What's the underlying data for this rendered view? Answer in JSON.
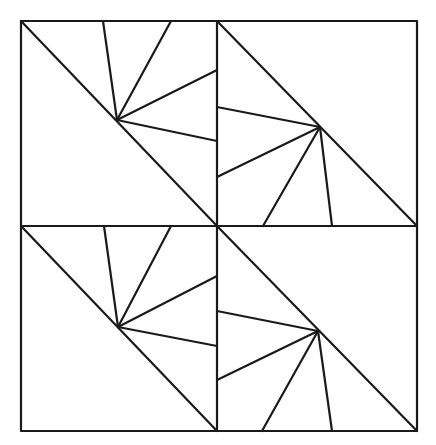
{
  "diagram": {
    "stroke_color": "#1a1a1a",
    "background_color": "#ffffff",
    "outer_square": {
      "x1": 21,
      "y1": 21,
      "x2": 417,
      "y2": 431
    },
    "center": {
      "x": 217,
      "y": 226
    },
    "quadrants": [
      {
        "name": "top-left",
        "diagonal": [
          [
            21,
            21
          ],
          [
            217,
            226
          ]
        ],
        "apex": [
          117,
          120
        ],
        "rays": [
          [
            103,
            21
          ],
          [
            171,
            21
          ],
          [
            217,
            70
          ],
          [
            217,
            141
          ]
        ]
      },
      {
        "name": "top-right",
        "diagonal": [
          [
            217,
            21
          ],
          [
            417,
            226
          ]
        ],
        "apex": [
          320,
          127
        ],
        "rays": [
          [
            217,
            107
          ],
          [
            217,
            177
          ],
          [
            263,
            226
          ],
          [
            332,
            226
          ]
        ]
      },
      {
        "name": "bottom-left",
        "diagonal": [
          [
            21,
            226
          ],
          [
            217,
            431
          ]
        ],
        "apex": [
          118,
          327
        ],
        "rays": [
          [
            104,
            226
          ],
          [
            171,
            226
          ],
          [
            217,
            276
          ],
          [
            217,
            346
          ]
        ]
      },
      {
        "name": "bottom-right",
        "diagonal": [
          [
            217,
            226
          ],
          [
            417,
            431
          ]
        ],
        "apex": [
          318,
          331
        ],
        "rays": [
          [
            217,
            311
          ],
          [
            217,
            380
          ],
          [
            262,
            431
          ],
          [
            332,
            431
          ]
        ]
      }
    ]
  }
}
